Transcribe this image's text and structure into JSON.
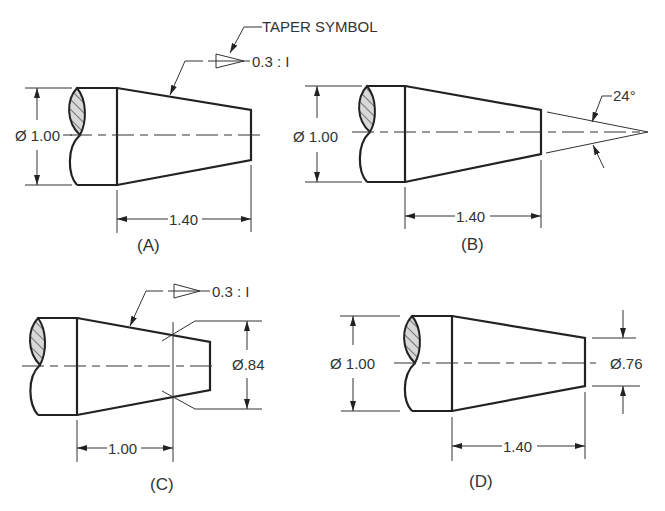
{
  "colors": {
    "line": "#222222",
    "text": "#333333",
    "hatch_fill": "#d8d8d8",
    "background": "#ffffff"
  },
  "views": [
    {
      "id": "A",
      "label": "(A)",
      "diameter_label": "Ø 1.00",
      "length_label": "1.40",
      "taper_ratio_label": "0.3 : I",
      "callout_label": "TAPER SYMBOL"
    },
    {
      "id": "B",
      "label": "(B)",
      "diameter_label": "Ø 1.00",
      "length_label": "1.40",
      "angle_label": "24°"
    },
    {
      "id": "C",
      "label": "(C)",
      "diameter_label": "Ø.84",
      "length_label": "1.00",
      "taper_ratio_label": "0.3 : I"
    },
    {
      "id": "D",
      "label": "(D)",
      "diameter_label": "Ø 1.00",
      "small_diameter_label": "Ø.76",
      "length_label": "1.40"
    }
  ]
}
